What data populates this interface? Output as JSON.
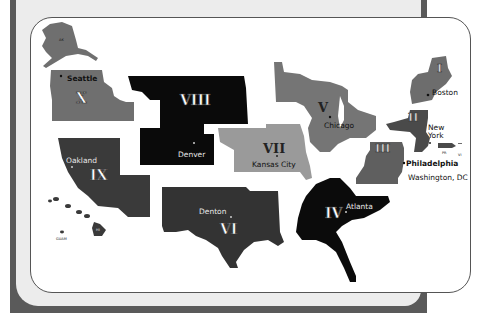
{
  "map": {
    "title": "EPA Regions Map",
    "colors": {
      "frame_dark": "#5a5a5a",
      "frame_light": "#ececec",
      "card_bg": "#ffffff",
      "card_border": "#555555"
    },
    "regions": [
      {
        "numeral": "I",
        "city": "Boston",
        "color": "#6d6d6d"
      },
      {
        "numeral": "II",
        "city": "New York",
        "city_line1": "New",
        "city_line2": "York",
        "color": "#4a4a4a"
      },
      {
        "numeral": "III",
        "city": "Philadelphia",
        "secondary_city": "Washington, DC",
        "color": "#5f5f5f"
      },
      {
        "numeral": "IV",
        "city": "Atlanta",
        "color": "#0b0b0b"
      },
      {
        "numeral": "V",
        "city": "Chicago",
        "color": "#757575"
      },
      {
        "numeral": "VI",
        "city": "Denton",
        "color": "#333333"
      },
      {
        "numeral": "VII",
        "city": "Kansas City",
        "color": "#9a9a9a"
      },
      {
        "numeral": "VIII",
        "city": "Denver",
        "color": "#0a0a0a"
      },
      {
        "numeral": "IX",
        "city": "Oakland",
        "color": "#3a3a3a"
      },
      {
        "numeral": "X",
        "city": "Seattle",
        "color": "#6f6f6f"
      }
    ],
    "territories": {
      "alaska": "AK",
      "hawaii": "HI",
      "guam": "GUAM",
      "puerto_rico": "PR",
      "virgin_islands": "VI"
    }
  }
}
